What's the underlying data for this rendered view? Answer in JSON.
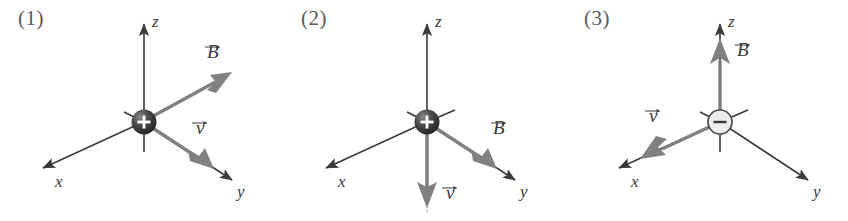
{
  "figure": {
    "type": "diagram",
    "background_color": "#ffffff",
    "axis_color": "#3a3a3a",
    "vector_color": "#808080",
    "label_color": "#3a3a3a",
    "panel_number_color": "#5a5a5a",
    "positive_charge_color": "#3c3c3c",
    "negative_charge_color": "#e8e8e8"
  },
  "panels": [
    {
      "number": "(1)",
      "charge": {
        "sign": "+",
        "type": "positive"
      },
      "axes": [
        {
          "name": "z",
          "label": "z",
          "direction": "up"
        },
        {
          "name": "x",
          "label": "x",
          "direction": "down-left"
        },
        {
          "name": "y",
          "label": "y",
          "direction": "down-right"
        }
      ],
      "vectors": [
        {
          "name": "B",
          "label": "B",
          "symbol": "⃗B",
          "direction": "up-right",
          "axis": "none"
        },
        {
          "name": "v",
          "label": "v",
          "symbol": "⃗v",
          "direction": "down-right",
          "axis": "+y"
        }
      ]
    },
    {
      "number": "(2)",
      "charge": {
        "sign": "+",
        "type": "positive"
      },
      "axes": [
        {
          "name": "z",
          "label": "z",
          "direction": "up"
        },
        {
          "name": "x",
          "label": "x",
          "direction": "down-left"
        },
        {
          "name": "y",
          "label": "y",
          "direction": "down-right"
        }
      ],
      "vectors": [
        {
          "name": "B",
          "label": "B",
          "symbol": "⃗B",
          "direction": "down-right",
          "axis": "+y"
        },
        {
          "name": "v",
          "label": "v",
          "symbol": "⃗v",
          "direction": "down",
          "axis": "-z"
        }
      ]
    },
    {
      "number": "(3)",
      "charge": {
        "sign": "−",
        "type": "negative"
      },
      "axes": [
        {
          "name": "z",
          "label": "z",
          "direction": "up"
        },
        {
          "name": "x",
          "label": "x",
          "direction": "down-left"
        },
        {
          "name": "y",
          "label": "y",
          "direction": "down-right"
        }
      ],
      "vectors": [
        {
          "name": "B",
          "label": "B",
          "symbol": "⃗B",
          "direction": "up",
          "axis": "+z"
        },
        {
          "name": "v",
          "label": "v",
          "symbol": "⃗v",
          "direction": "down-left",
          "axis": "-x"
        }
      ]
    }
  ]
}
